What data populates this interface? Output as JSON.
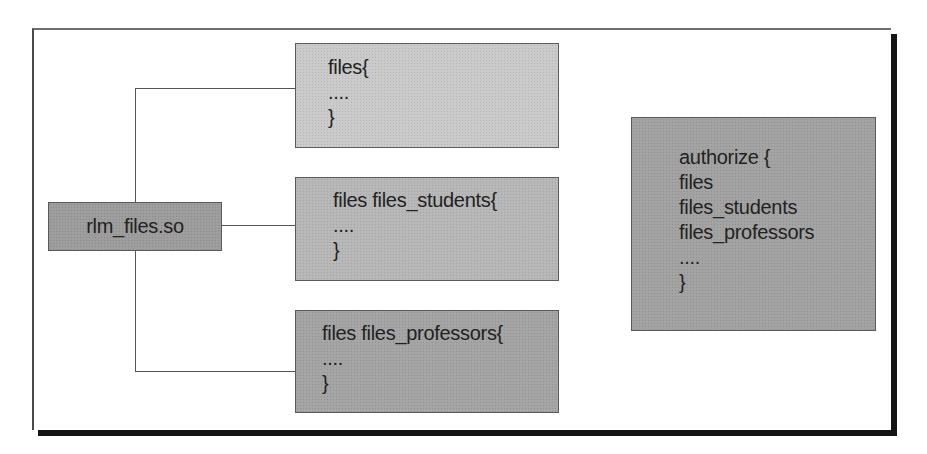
{
  "diagram": {
    "module_box": {
      "label": "rlm_files.so",
      "fill": "#9c9c9c"
    },
    "instances": [
      {
        "lines": [
          "files{",
          "....",
          "}"
        ],
        "fill": "#cacaca"
      },
      {
        "lines": [
          "files files_students{",
          "....",
          "}"
        ],
        "fill": "#b7b7b7"
      },
      {
        "lines": [
          "files files_professors{",
          "....",
          "}"
        ],
        "fill": "#a4a4a4"
      }
    ],
    "authorize_box": {
      "lines": [
        "authorize {",
        "files",
        "files_students",
        "files_professors",
        "....",
        "}"
      ],
      "fill": "#a2a2a2"
    },
    "colors": {
      "line": "#555555",
      "border": "#5a5a5a",
      "shadow": "#141414",
      "text": "#222222"
    }
  }
}
